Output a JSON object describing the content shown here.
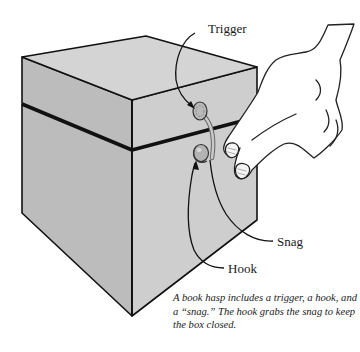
{
  "diagram": {
    "labels": {
      "trigger": "Trigger",
      "snag": "Snag",
      "hook": "Hook"
    },
    "caption": "A book hasp includes a trigger, a hook, and a “snag.” The hook grabs the snag to keep the box closed.",
    "colors": {
      "top_face": "#d2d2d2",
      "left_face": "#bcbcbc",
      "right_face": "#cecece",
      "outline": "#111111",
      "hardware": "#b8b8b8",
      "background": "#ffffff"
    }
  }
}
